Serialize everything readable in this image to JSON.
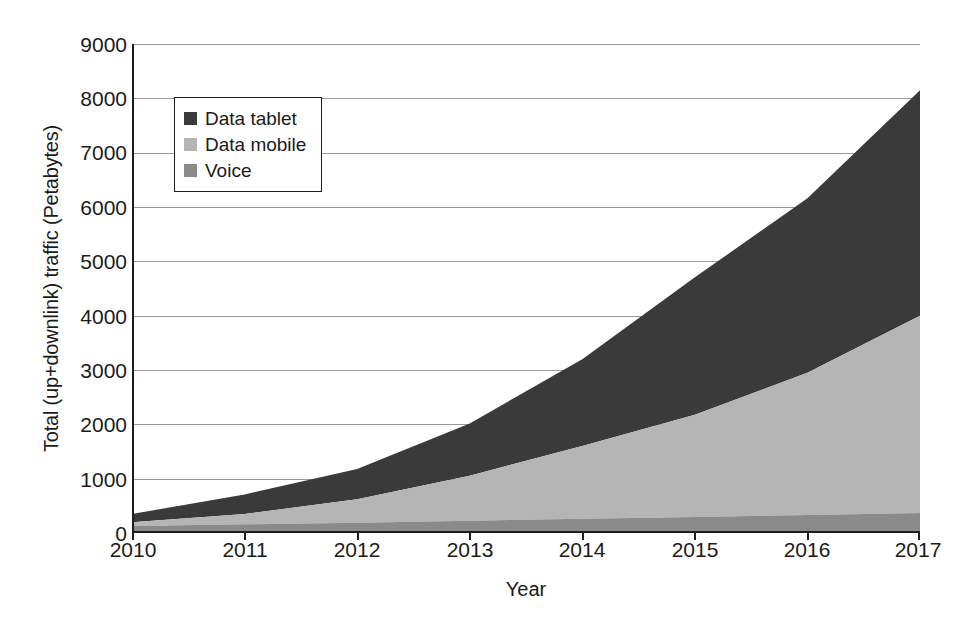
{
  "chart_data": {
    "type": "area",
    "stacked": true,
    "title": "",
    "xlabel": "Year",
    "ylabel": "Total (up+downlink) traffic (Petabytes)",
    "x": [
      2010,
      2011,
      2012,
      2013,
      2014,
      2015,
      2016,
      2017
    ],
    "categories": [
      "2010",
      "2011",
      "2012",
      "2013",
      "2014",
      "2015",
      "2016",
      "2017"
    ],
    "xlim": [
      2010,
      2017
    ],
    "ylim": [
      0,
      9000
    ],
    "yticks": [
      0,
      1000,
      2000,
      3000,
      4000,
      5000,
      6000,
      7000,
      8000,
      9000
    ],
    "ytick_labels": [
      "0",
      "1000",
      "2000",
      "3000",
      "4000",
      "5000",
      "6000",
      "7000",
      "8000",
      "9000"
    ],
    "xticks": [
      2010,
      2011,
      2012,
      2013,
      2014,
      2015,
      2016,
      2017
    ],
    "xtick_labels": [
      "2010",
      "2011",
      "2012",
      "2013",
      "2014",
      "2015",
      "2016",
      "2017"
    ],
    "grid": "horizontal",
    "legend_position": "upper-left-inside",
    "stack_order_bottom_to_top": [
      "Voice",
      "Data mobile",
      "Data tablet"
    ],
    "series": [
      {
        "name": "Voice",
        "color": "#8a8a8a",
        "values": [
          130,
          160,
          190,
          225,
          260,
          295,
          330,
          370
        ]
      },
      {
        "name": "Data mobile",
        "color": "#b5b5b5",
        "values": [
          70,
          190,
          430,
          830,
          1340,
          1880,
          2620,
          3630
        ]
      },
      {
        "name": "Data tablet",
        "color": "#3a3a3a",
        "values": [
          150,
          360,
          560,
          960,
          1600,
          2530,
          3210,
          4150
        ]
      }
    ],
    "cumulative_totals": [
      350,
      710,
      1180,
      2015,
      3200,
      4705,
      6160,
      8150
    ],
    "cumulative_voice_top": [
      130,
      160,
      190,
      225,
      260,
      295,
      330,
      370
    ],
    "cumulative_mobile_top": [
      200,
      350,
      620,
      1055,
      1600,
      2175,
      2950,
      4000
    ]
  },
  "legend": {
    "items": [
      {
        "label": "Data tablet",
        "color": "#3a3a3a",
        "icon": "square-swatch-icon"
      },
      {
        "label": "Data mobile",
        "color": "#b5b5b5",
        "icon": "square-swatch-icon"
      },
      {
        "label": "Voice",
        "color": "#8a8a8a",
        "icon": "square-swatch-icon"
      }
    ]
  },
  "caption": ""
}
